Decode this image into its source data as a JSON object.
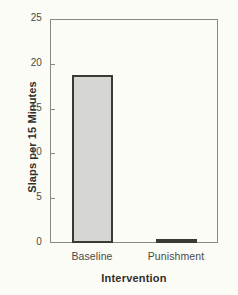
{
  "chart_data": {
    "type": "bar",
    "title": "",
    "xlabel": "Intervention",
    "ylabel": "Slaps per 15 Minutes",
    "categories": [
      "Baseline",
      "Punishment"
    ],
    "values": [
      18.7,
      0.4
    ],
    "ylim": [
      0,
      25
    ],
    "yticks": [
      0,
      5,
      10,
      15,
      20,
      25
    ],
    "ytick_labels": [
      "0",
      "5",
      "10",
      "15",
      "20",
      "25"
    ],
    "grid": false,
    "legend": null,
    "bar_fill_color": "#d6d6d2",
    "bar_edge_color": "#3a3a32",
    "axis_color": "#8a8a80",
    "background_color": "#fcfcf7"
  }
}
